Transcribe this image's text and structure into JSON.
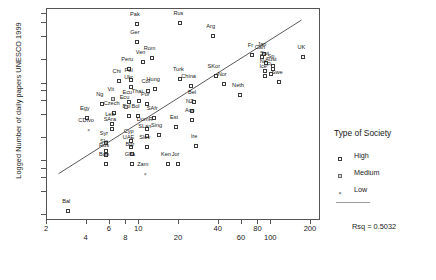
{
  "chart_data": {
    "type": "scatter",
    "title": "",
    "xlabel": "",
    "ylabel": "Logged Number of daily papers UNESCO 1999",
    "xscale": "log",
    "yscale": "log",
    "xlim": [
      2,
      230
    ],
    "ylim": [
      0.9,
      460
    ],
    "grid": false,
    "legend_position": "right",
    "xticks": [
      2,
      4,
      6,
      8,
      10,
      20,
      40,
      60,
      80,
      100,
      200
    ],
    "xticks_upper": [
      2,
      6,
      10,
      40,
      80,
      200
    ],
    "xticks_lower": [
      4,
      8,
      20,
      60,
      100
    ],
    "yticks": [
      1,
      2,
      3,
      4,
      5,
      10,
      20,
      30,
      40,
      50,
      100,
      200,
      300,
      400
    ],
    "annotation": "Rsq = 0.5032",
    "regression_line": {
      "x0": 2.45,
      "y0": 3.3,
      "x1": 175,
      "y1": 330
    },
    "series": [
      {
        "name": "High",
        "marker": "open-square",
        "points": [
          {
            "label": "Pak",
            "x": 9.6,
            "y": 295
          },
          {
            "label": "Rus",
            "x": 20.5,
            "y": 300
          },
          {
            "label": "Ger",
            "x": 9.6,
            "y": 175
          },
          {
            "label": "Arg",
            "x": 36.0,
            "y": 205
          },
          {
            "label": "Rom",
            "x": 12.4,
            "y": 108
          },
          {
            "label": "Ven",
            "x": 10.6,
            "y": 95
          },
          {
            "label": "Peru",
            "x": 8.4,
            "y": 78
          },
          {
            "label": "Fr",
            "x": 72.0,
            "y": 118
          },
          {
            "label": "Jap",
            "x": 88.0,
            "y": 122
          },
          {
            "label": "Swi",
            "x": 92.0,
            "y": 92
          },
          {
            "label": "Sp",
            "x": 103.0,
            "y": 85
          },
          {
            "label": "Ne",
            "x": 90.0,
            "y": 72
          },
          {
            "label": "Ice",
            "x": 90.0,
            "y": 63
          },
          {
            "label": "Chi",
            "x": 7.0,
            "y": 54
          },
          {
            "label": "Pol",
            "x": 8.6,
            "y": 56
          },
          {
            "label": "Ukr",
            "x": 8.6,
            "y": 46
          },
          {
            "label": "Turk",
            "x": 20.5,
            "y": 58
          },
          {
            "label": "SKor",
            "x": 38.0,
            "y": 62
          },
          {
            "label": "China",
            "x": 24.5,
            "y": 47
          },
          {
            "label": "Nor",
            "x": 44.0,
            "y": 50
          },
          {
            "label": "Swe",
            "x": 115.0,
            "y": 52
          },
          {
            "label": "Col",
            "x": 11.6,
            "y": 40
          },
          {
            "label": "Hung",
            "x": 13.2,
            "y": 43
          },
          {
            "label": "Neth",
            "x": 58.0,
            "y": 36
          },
          {
            "label": "Can",
            "x": 85.0,
            "y": 112
          },
          {
            "label": "UK",
            "x": 175.0,
            "y": 112
          },
          {
            "label": "Aust",
            "x": 103.0,
            "y": 77
          },
          {
            "label": "Fi",
            "x": 100.0,
            "y": 66
          },
          {
            "label": "Ecu",
            "x": 8.4,
            "y": 29
          },
          {
            "label": "Thai",
            "x": 10.0,
            "y": 30
          },
          {
            "label": "Por",
            "x": 11.5,
            "y": 27
          },
          {
            "label": "Bel",
            "x": 26.0,
            "y": 29
          },
          {
            "label": "NZ",
            "x": 25.0,
            "y": 22
          },
          {
            "label": "Ng",
            "x": 5.2,
            "y": 27
          },
          {
            "label": "Czech",
            "x": 6.4,
            "y": 21
          },
          {
            "label": "Bul",
            "x": 8.3,
            "y": 19
          },
          {
            "label": "Bol",
            "x": 9.7,
            "y": 19
          },
          {
            "label": "SAfr",
            "x": 13.0,
            "y": 18
          },
          {
            "label": "Aus",
            "x": 25.0,
            "y": 17
          },
          {
            "label": "Est",
            "x": 19.0,
            "y": 14
          },
          {
            "label": "Egy",
            "x": 4.0,
            "y": 18
          },
          {
            "label": "Leb",
            "x": 6.2,
            "y": 15
          },
          {
            "label": "SAra",
            "x": 6.2,
            "y": 13
          },
          {
            "label": "DomR",
            "x": 11.4,
            "y": 13
          },
          {
            "label": "Sing",
            "x": 14.0,
            "y": 11
          },
          {
            "label": "SLan",
            "x": 11.4,
            "y": 10.5
          },
          {
            "label": "Cyp",
            "x": 8.6,
            "y": 9.2
          },
          {
            "label": "Syr",
            "x": 5.6,
            "y": 8.6
          },
          {
            "label": "UAE",
            "x": 8.6,
            "y": 7.6
          },
          {
            "label": "Slov",
            "x": 11.4,
            "y": 7.6
          },
          {
            "label": "Ire",
            "x": 27.0,
            "y": 7.8
          },
          {
            "label": "Slo",
            "x": 5.6,
            "y": 6.8
          },
          {
            "label": "Rus2",
            "x": 5.6,
            "y": 6.0
          },
          {
            "label": "Bgr",
            "x": 8.8,
            "y": 6.2
          },
          {
            "label": "Ban",
            "x": 5.6,
            "y": 4.6
          },
          {
            "label": "Gha",
            "x": 8.8,
            "y": 4.6
          },
          {
            "label": "Ken",
            "x": 16.5,
            "y": 4.6
          },
          {
            "label": "Jor",
            "x": 19.5,
            "y": 4.6
          },
          {
            "label": "Bal",
            "x": 2.9,
            "y": 1.15
          }
        ]
      },
      {
        "name": "Medium",
        "marker": "filled-square",
        "points": [
          {
            "label": "Vit",
            "x": 6.3,
            "y": 32
          },
          {
            "label": "Ecu2",
            "x": 8.0,
            "y": 25
          }
        ]
      },
      {
        "name": "Low",
        "marker": "cross",
        "points": [
          {
            "label": "CDIvo",
            "x": 4.1,
            "y": 12.5
          },
          {
            "label": "Zam",
            "x": 11.0,
            "y": 3.4
          }
        ]
      }
    ]
  },
  "legend": {
    "title": "Type of Society",
    "entries": [
      {
        "label": "High",
        "marker": "open-square"
      },
      {
        "label": "Medium",
        "marker": "filled-square"
      },
      {
        "label": "Low",
        "marker": "cross"
      }
    ]
  },
  "footer": {
    "rsq": "Rsq = 0.5032"
  }
}
